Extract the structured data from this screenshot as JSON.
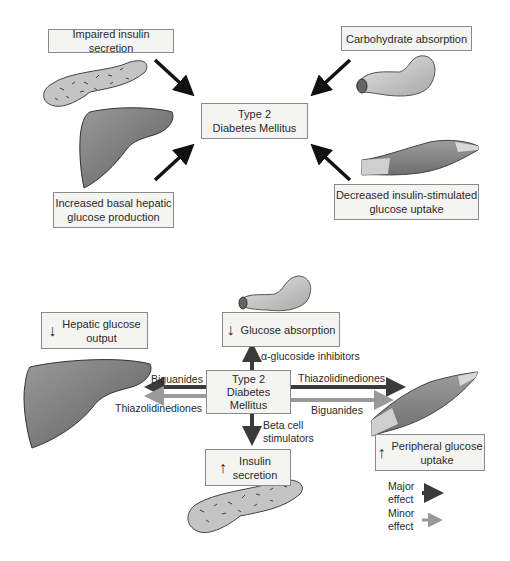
{
  "top_diagram": {
    "center": {
      "line1": "Type 2",
      "line2": "Diabetes Mellitus"
    },
    "factors": [
      {
        "id": "insulin",
        "text": "Impaired insulin secretion",
        "organ": "pancreas"
      },
      {
        "id": "carb",
        "text": "Carbohydrate absorption",
        "organ": "intestine"
      },
      {
        "id": "hepatic",
        "line1": "Increased basal hepatic",
        "line2": "glucose production",
        "organ": "liver"
      },
      {
        "id": "uptake",
        "line1": "Decreased insulin-stimulated",
        "line2": "glucose uptake",
        "organ": "muscle"
      }
    ]
  },
  "bottom_diagram": {
    "center": {
      "line1": "Type 2",
      "line2": "Diabetes",
      "line3": "Mellitus"
    },
    "effects": {
      "hepatic": {
        "arrow": "↓",
        "line1": "Hepatic glucose",
        "line2": "output"
      },
      "absorption": {
        "arrow": "↓",
        "text": "Glucose absorption"
      },
      "insulin": {
        "arrow": "↑",
        "line1": "Insulin",
        "line2": "secretion"
      },
      "peripheral": {
        "arrow": "↑",
        "line1": "Peripheral glucose",
        "line2": "uptake"
      }
    },
    "drugs": {
      "alpha": "α-glucoside inhibitors",
      "biguanides_left": "Biguanides",
      "thiazo_left": "Thiazolidinediones",
      "thiazo_right": "Thiazolidinediones",
      "biguanides_right": "Biguanides",
      "beta_line1": "Beta cell",
      "beta_line2": "stimulators"
    },
    "legend": {
      "major_line1": "Major",
      "major_line2": "effect",
      "major_color": "#3a3a3a",
      "minor_line1": "Minor",
      "minor_line2": "effect",
      "minor_color": "#9a9a9a"
    }
  }
}
